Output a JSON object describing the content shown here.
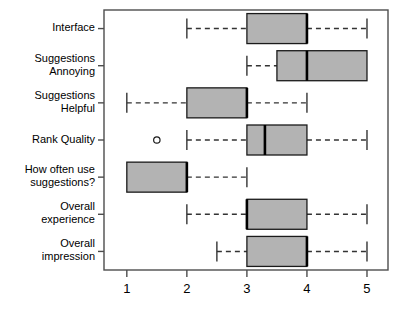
{
  "chart_data": {
    "type": "boxplot",
    "title": "",
    "xlabel": "",
    "ylabel": "",
    "orientation": "horizontal",
    "xlim": [
      0.62,
      5.35
    ],
    "xticks": [
      1,
      2,
      3,
      4,
      5
    ],
    "xtick_labels": [
      "1",
      "2",
      "3",
      "4",
      "5"
    ],
    "grid": false,
    "legend": null,
    "categories": [
      "Interface",
      "Suggestions\nAnnoying",
      "Suggestions\nHelpful",
      "Rank Quality",
      "How often use\nsuggestions?",
      "Overall\nexperience",
      "Overall\nimpression"
    ],
    "boxes": [
      {
        "label": "Interface",
        "whisker_low": 2.0,
        "q1": 3.0,
        "median": 4.0,
        "q3": 4.0,
        "whisker_high": 5.0,
        "outliers": []
      },
      {
        "label": "Suggestions Annoying",
        "whisker_low": 3.0,
        "q1": 3.5,
        "median": 4.0,
        "q3": 5.0,
        "whisker_high": 5.0,
        "outliers": []
      },
      {
        "label": "Suggestions Helpful",
        "whisker_low": 1.0,
        "q1": 2.0,
        "median": 3.0,
        "q3": 3.0,
        "whisker_high": 4.0,
        "outliers": []
      },
      {
        "label": "Rank Quality",
        "whisker_low": 2.0,
        "q1": 3.0,
        "median": 3.3,
        "q3": 4.0,
        "whisker_high": 5.0,
        "outliers": [
          1.5
        ]
      },
      {
        "label": "How often use suggestions?",
        "whisker_low": 1.0,
        "q1": 1.0,
        "median": 2.0,
        "q3": 2.0,
        "whisker_high": 3.0,
        "outliers": []
      },
      {
        "label": "Overall experience",
        "whisker_low": 2.0,
        "q1": 3.0,
        "median": 3.0,
        "q3": 4.0,
        "whisker_high": 5.0,
        "outliers": []
      },
      {
        "label": "Overall impression",
        "whisker_low": 2.5,
        "q1": 3.0,
        "median": 4.0,
        "q3": 4.0,
        "whisker_high": 5.0,
        "outliers": []
      }
    ],
    "colors": {
      "box_fill": "#b3b3b3",
      "box_stroke": "#1a1a1a",
      "median": "#000000",
      "whisker": "#333333",
      "axis": "#4d4d4d",
      "text": "#000000",
      "background": "#ffffff"
    }
  }
}
